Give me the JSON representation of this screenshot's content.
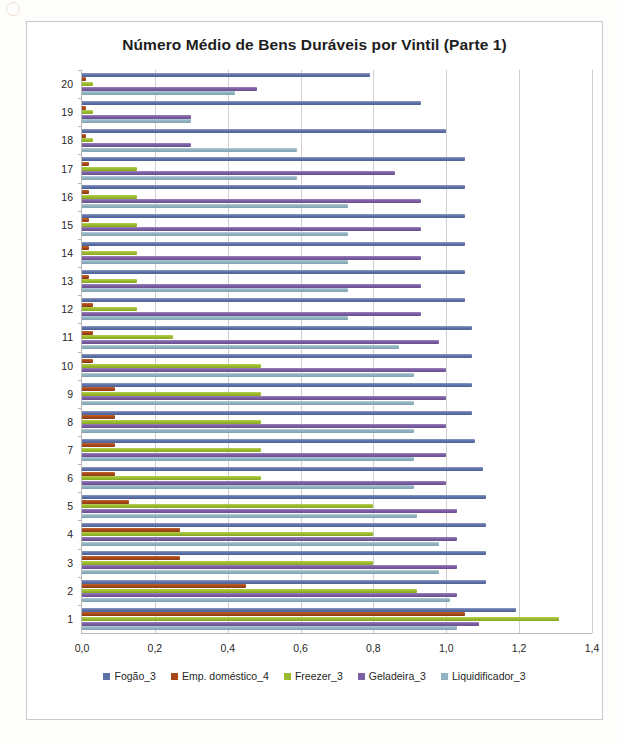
{
  "chart_title": "Número Médio de Bens Duráveis por Vintil (Parte 1)",
  "axis": {
    "x_ticks": [
      "0,0",
      "0,2",
      "0,4",
      "0,6",
      "0,8",
      "1,0",
      "1,2",
      "1,4"
    ],
    "y_ticks": [
      "20",
      "19",
      "18",
      "17",
      "16",
      "15",
      "14",
      "13",
      "12",
      "11",
      "10",
      "9",
      "8",
      "7",
      "6",
      "5",
      "4",
      "3",
      "2",
      "1"
    ]
  },
  "legend": {
    "items": [
      {
        "label": "Fogão_3",
        "color": "#5f72a8"
      },
      {
        "label": "Emp. doméstico_4",
        "color": "#a8481a"
      },
      {
        "label": "Freezer_3",
        "color": "#9bbb2e"
      },
      {
        "label": "Geladeira_3",
        "color": "#7c5ea3"
      },
      {
        "label": "Liquidificador_3",
        "color": "#92b2c1"
      }
    ]
  },
  "chart_data": {
    "type": "bar",
    "orientation": "horizontal",
    "title": "Número Médio de Bens Duráveis por Vintil (Parte 1)",
    "xlabel": "",
    "ylabel": "",
    "xlim": [
      0,
      1.4
    ],
    "xticks": [
      0,
      0.2,
      0.4,
      0.6,
      0.8,
      1.0,
      1.2,
      1.4
    ],
    "grid": true,
    "legend_position": "bottom",
    "categories": [
      "20",
      "19",
      "18",
      "17",
      "16",
      "15",
      "14",
      "13",
      "12",
      "11",
      "10",
      "9",
      "8",
      "7",
      "6",
      "5",
      "4",
      "3",
      "2",
      "1"
    ],
    "category_order": "descending-top-to-bottom",
    "series": [
      {
        "name": "Fogão_3",
        "color": "#5f72a8",
        "values": [
          0.79,
          0.93,
          1.0,
          1.05,
          1.05,
          1.05,
          1.05,
          1.05,
          1.05,
          1.07,
          1.07,
          1.07,
          1.07,
          1.08,
          1.1,
          1.11,
          1.11,
          1.11,
          1.11,
          1.19
        ]
      },
      {
        "name": "Emp. doméstico_4",
        "color": "#a8481a",
        "values": [
          0.01,
          0.01,
          0.01,
          0.02,
          0.02,
          0.02,
          0.02,
          0.02,
          0.03,
          0.03,
          0.03,
          0.09,
          0.09,
          0.09,
          0.09,
          0.13,
          0.27,
          0.27,
          0.45,
          1.05
        ]
      },
      {
        "name": "Freezer_3",
        "color": "#9bbb2e",
        "values": [
          0.03,
          0.03,
          0.03,
          0.15,
          0.15,
          0.15,
          0.15,
          0.15,
          0.15,
          0.25,
          0.49,
          0.49,
          0.49,
          0.49,
          0.49,
          0.8,
          0.8,
          0.8,
          0.92,
          1.31
        ]
      },
      {
        "name": "Geladeira_3",
        "color": "#7c5ea3",
        "values": [
          0.48,
          0.3,
          0.3,
          0.86,
          0.93,
          0.93,
          0.93,
          0.93,
          0.93,
          0.98,
          1.0,
          1.0,
          1.0,
          1.0,
          1.0,
          1.03,
          1.03,
          1.03,
          1.03,
          1.09
        ]
      },
      {
        "name": "Liquidificador_3",
        "color": "#92b2c1",
        "values": [
          0.42,
          0.3,
          0.59,
          0.59,
          0.73,
          0.73,
          0.73,
          0.73,
          0.73,
          0.87,
          0.91,
          0.91,
          0.91,
          0.91,
          0.91,
          0.92,
          0.98,
          0.98,
          1.01,
          1.03
        ]
      }
    ]
  }
}
